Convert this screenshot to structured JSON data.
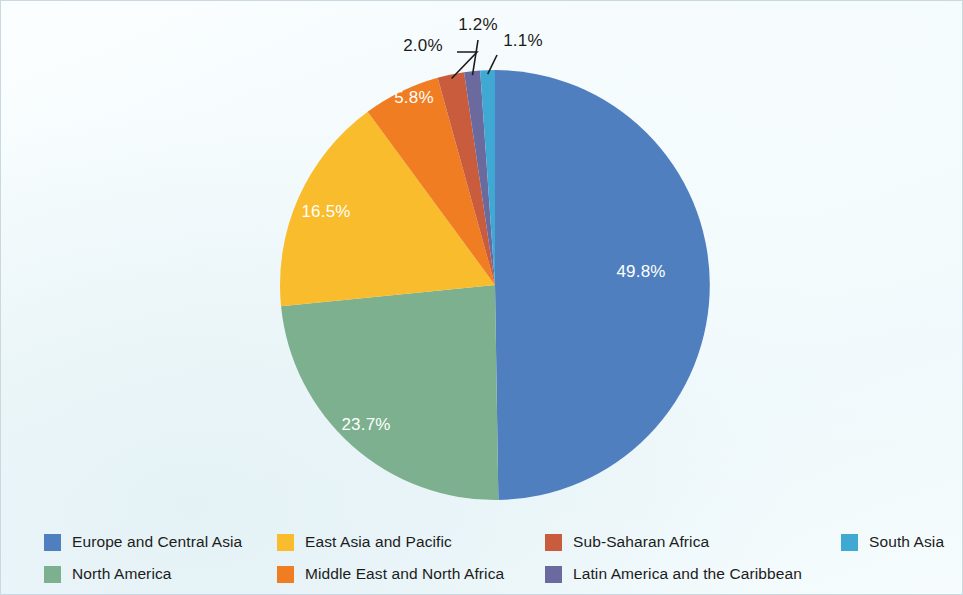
{
  "chart_data": {
    "type": "pie",
    "title": "",
    "subtitle": "",
    "labels": [
      "Europe and Central Asia",
      "North America",
      "East Asia and Pacific",
      "Middle East and North Africa",
      "Sub-Saharan Africa",
      "Latin America and the Caribbean",
      "South Asia"
    ],
    "values": [
      49.8,
      23.7,
      16.5,
      5.8,
      2.0,
      1.2,
      1.1
    ],
    "value_labels": [
      "49.8%",
      "23.7%",
      "16.5%",
      "5.8%",
      "2.0%",
      "1.2%",
      "1.1%"
    ],
    "colors": [
      "#4f7fbf",
      "#7cb08e",
      "#f9bc2c",
      "#f07d22",
      "#c85c3c",
      "#6b6a9e",
      "#3fa9d4"
    ],
    "units": "percent",
    "total": 100.1,
    "start_angle_deg": 0,
    "direction": "clockwise",
    "legend_position": "bottom",
    "grid": false,
    "inside_labels": [
      "49.8%",
      "23.7%",
      "16.5%",
      "5.8%"
    ],
    "callout_labels": [
      "2.0%",
      "1.2%",
      "1.1%"
    ]
  },
  "slices": [
    {
      "label": "Europe and Central Asia",
      "value_label": "49.8%",
      "value": 49.8,
      "color": "#4f7fbf",
      "label_placement": "inside"
    },
    {
      "label": "North America",
      "value_label": "23.7%",
      "value": 23.7,
      "color": "#7cb08e",
      "label_placement": "inside"
    },
    {
      "label": "East Asia and Pacific",
      "value_label": "16.5%",
      "value": 16.5,
      "color": "#f9bc2c",
      "label_placement": "inside"
    },
    {
      "label": "Middle East and North Africa",
      "value_label": "5.8%",
      "value": 5.8,
      "color": "#f07d22",
      "label_placement": "inside"
    },
    {
      "label": "Sub-Saharan Africa",
      "value_label": "2.0%",
      "value": 2.0,
      "color": "#c85c3c",
      "label_placement": "callout"
    },
    {
      "label": "Latin America and the Caribbean",
      "value_label": "1.2%",
      "value": 1.2,
      "color": "#6b6a9e",
      "label_placement": "callout"
    },
    {
      "label": "South Asia",
      "value_label": "1.1%",
      "value": 1.1,
      "color": "#3fa9d4",
      "label_placement": "callout"
    }
  ],
  "legend": {
    "items": [
      {
        "label": "Europe and Central Asia",
        "color": "#4f7fbf"
      },
      {
        "label": "East Asia and Pacific",
        "color": "#f9bc2c"
      },
      {
        "label": "Sub-Saharan Africa",
        "color": "#c85c3c"
      },
      {
        "label": "South Asia",
        "color": "#3fa9d4"
      },
      {
        "label": "North America",
        "color": "#7cb08e"
      },
      {
        "label": "Middle East and North Africa",
        "color": "#f07d22"
      },
      {
        "label": "Latin America and the Caribbean",
        "color": "#6b6a9e"
      }
    ]
  },
  "theme": {
    "background": "#f2fafc",
    "border_color": "#c9d9df",
    "inside_label_color": "#ffffff",
    "callout_label_color": "#1b1b1b",
    "leader_line_color": "#1b1b1b"
  }
}
